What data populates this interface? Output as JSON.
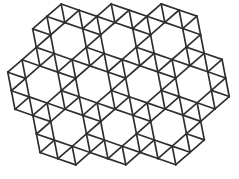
{
  "figure": {
    "background": "#ffffff",
    "stroke_color": "#2f2f2f",
    "stroke_width": 1.7
  },
  "lattice": {
    "origin": [
      43.5,
      84.5
    ],
    "edge_length": 18.9,
    "angle_deg": 19,
    "ring_radius": 2,
    "holes": [
      [
        2,
        -3
      ],
      [
        5,
        -4
      ],
      [
        8,
        -5
      ],
      [
        0,
        0
      ],
      [
        3,
        -1
      ],
      [
        6,
        -2
      ],
      [
        9,
        -3
      ],
      [
        1,
        2
      ],
      [
        4,
        1
      ],
      [
        7,
        0
      ]
    ]
  }
}
